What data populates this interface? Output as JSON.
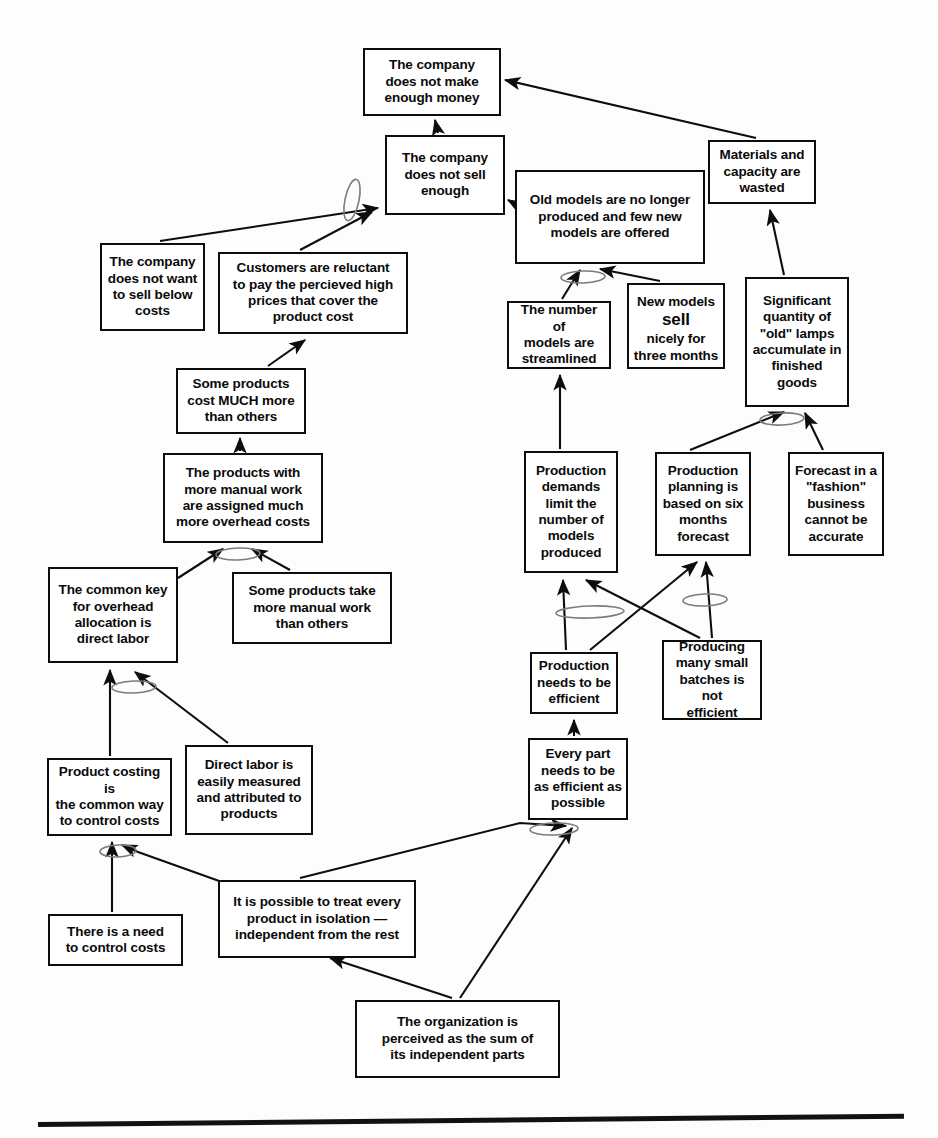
{
  "diagram": {
    "type": "cause-effect-tree",
    "stroke_color": "#0d0d0d",
    "background_color": "#ffffff",
    "nodes": [
      {
        "id": "n1",
        "text": "The company\ndoes not make\nenough money",
        "x": 363,
        "y": 48,
        "w": 138,
        "h": 68,
        "size": "md"
      },
      {
        "id": "n2",
        "text": "The company\ndoes not sell\nenough",
        "x": 385,
        "y": 135,
        "w": 120,
        "h": 80,
        "size": "md"
      },
      {
        "id": "n3",
        "text": "Old models are no longer\nproduced and few new\nmodels are offered",
        "x": 515,
        "y": 170,
        "w": 190,
        "h": 94,
        "size": "md"
      },
      {
        "id": "n4",
        "text": "Materials and\ncapacity are\nwasted",
        "x": 708,
        "y": 140,
        "w": 108,
        "h": 64,
        "size": "md"
      },
      {
        "id": "n5",
        "text": "The company\ndoes not want\nto sell below\ncosts",
        "x": 100,
        "y": 243,
        "w": 105,
        "h": 88,
        "size": "md"
      },
      {
        "id": "n6",
        "text": "Customers are reluctant\nto pay the percieved high\nprices that cover the\nproduct cost",
        "x": 218,
        "y": 252,
        "w": 190,
        "h": 82,
        "size": "md"
      },
      {
        "id": "n7",
        "text": "The number of\nmodels are\nstreamlined",
        "x": 507,
        "y": 301,
        "w": 104,
        "h": 68,
        "size": "md"
      },
      {
        "id": "n8",
        "text": "New models\nsell\nnicely for\nthree months",
        "x": 627,
        "y": 283,
        "w": 98,
        "h": 86,
        "size": "md",
        "emph_line": 1
      },
      {
        "id": "n9",
        "text": "Significant\nquantity of\n\"old\" lamps\naccumulate in\nfinished\ngoods",
        "x": 745,
        "y": 277,
        "w": 104,
        "h": 130,
        "size": "md"
      },
      {
        "id": "n10",
        "text": "Some products\ncost  MUCH more\nthan others",
        "x": 176,
        "y": 368,
        "w": 130,
        "h": 66,
        "size": "md"
      },
      {
        "id": "n11",
        "text": "The products with\nmore manual work\nare assigned much\nmore overhead costs",
        "x": 163,
        "y": 453,
        "w": 160,
        "h": 90,
        "size": "md"
      },
      {
        "id": "n12",
        "text": "Production\ndemands\nlimit the\nnumber of\nmodels\nproduced",
        "x": 524,
        "y": 451,
        "w": 94,
        "h": 122,
        "size": "md"
      },
      {
        "id": "n13",
        "text": "Production\nplanning is\nbased on six\nmonths\nforecast",
        "x": 655,
        "y": 452,
        "w": 96,
        "h": 104,
        "size": "md"
      },
      {
        "id": "n14",
        "text": "Forecast in a\n\"fashion\"\nbusiness\ncannot be\naccurate",
        "x": 788,
        "y": 452,
        "w": 96,
        "h": 104,
        "size": "md"
      },
      {
        "id": "n15",
        "text": "The common key\nfor overhead\nallocation is\ndirect labor",
        "x": 48,
        "y": 567,
        "w": 130,
        "h": 96,
        "size": "md"
      },
      {
        "id": "n16",
        "text": "Some products take\nmore manual work\nthan others",
        "x": 232,
        "y": 572,
        "w": 160,
        "h": 72,
        "size": "md"
      },
      {
        "id": "n17",
        "text": "Production\nneeds to be\nefficient",
        "x": 530,
        "y": 652,
        "w": 88,
        "h": 62,
        "size": "md"
      },
      {
        "id": "n18",
        "text": "Producing\nmany small\nbatches is not\nefficient",
        "x": 662,
        "y": 640,
        "w": 100,
        "h": 80,
        "size": "md"
      },
      {
        "id": "n19",
        "text": "Product costing is\nthe common way\nto control costs",
        "x": 47,
        "y": 758,
        "w": 125,
        "h": 78,
        "size": "md"
      },
      {
        "id": "n20",
        "text": "Direct labor is\neasily measured\nand attributed to\nproducts",
        "x": 185,
        "y": 745,
        "w": 128,
        "h": 90,
        "size": "md"
      },
      {
        "id": "n21",
        "text": "Every part\nneeds to be\nas efficient as\npossible",
        "x": 528,
        "y": 738,
        "w": 100,
        "h": 82,
        "size": "md"
      },
      {
        "id": "n22",
        "text": "It is possible to treat every\nproduct in isolation —\nindependent from the rest",
        "x": 218,
        "y": 880,
        "w": 198,
        "h": 78,
        "size": "md"
      },
      {
        "id": "n23",
        "text": "There is a need\nto control costs",
        "x": 48,
        "y": 914,
        "w": 135,
        "h": 52,
        "size": "md"
      },
      {
        "id": "n24",
        "text": "The organization is\nperceived as the sum of\nits independent parts",
        "x": 355,
        "y": 1000,
        "w": 205,
        "h": 78,
        "size": "md"
      }
    ],
    "edges": [
      {
        "from": "n2",
        "to": "n1",
        "label": "company does not sell enough causes not enough money"
      },
      {
        "from": "n4",
        "to": "n1",
        "label": "wasted materials cause not enough money"
      },
      {
        "from": "n5",
        "to": "n2",
        "label": "does not want to sell below costs causes not sell enough"
      },
      {
        "from": "n6",
        "to": "n2",
        "label": "reluctant customers cause not sell enough"
      },
      {
        "from": "n3",
        "to": "n2",
        "label": "old models not produced causes not sell enough"
      },
      {
        "from": "n7",
        "to": "n3",
        "label": "streamlined models cause old models not produced"
      },
      {
        "from": "n8",
        "to": "n3",
        "label": "new models sell nicely causes old models not produced"
      },
      {
        "from": "n9",
        "to": "n4",
        "label": "old lamps accumulate causes waste"
      },
      {
        "from": "n10",
        "to": "n6",
        "label": "cost differences cause reluctance"
      },
      {
        "from": "n11",
        "to": "n10",
        "label": "overhead assignment causes cost differences"
      },
      {
        "from": "n15",
        "to": "n11",
        "label": "common key overhead causes assignment"
      },
      {
        "from": "n16",
        "to": "n11",
        "label": "manual work differences cause assignment"
      },
      {
        "from": "n12",
        "to": "n7",
        "label": "production demands cause streamlining"
      },
      {
        "from": "n13",
        "to": "n9",
        "label": "six month forecast causes accumulation"
      },
      {
        "from": "n14",
        "to": "n9",
        "label": "inaccurate fashion forecast causes accumulation"
      },
      {
        "from": "n17",
        "to": "n12",
        "label": "production efficiency causes demand limits"
      },
      {
        "from": "n18",
        "to": "n12",
        "label": "small batches inefficient causes demand limits"
      },
      {
        "from": "n17",
        "to": "n13",
        "label": "production efficiency causes forecast planning"
      },
      {
        "from": "n18",
        "to": "n13",
        "label": "small batches inefficient causes forecast planning"
      },
      {
        "from": "n21",
        "to": "n17",
        "label": "every part efficient causes production efficiency"
      },
      {
        "from": "n19",
        "to": "n15",
        "label": "product costing causes overhead key"
      },
      {
        "from": "n20",
        "to": "n15",
        "label": "direct labor measurable causes overhead key"
      },
      {
        "from": "n23",
        "to": "n19",
        "label": "need to control costs causes product costing"
      },
      {
        "from": "n22",
        "to": "n19",
        "label": "treat products in isolation causes product costing"
      },
      {
        "from": "n22",
        "to": "n21",
        "label": "treat products in isolation causes every part efficient"
      },
      {
        "from": "n24",
        "to": "n22",
        "label": "organization as sum of parts causes isolation view"
      },
      {
        "from": "n24",
        "to": "n21",
        "label": "organization as sum of parts causes every part efficient"
      }
    ],
    "and_connectors": [
      {
        "id": "a1",
        "x": 350,
        "y": 197,
        "label": "and-connector-sell-enough",
        "rot": -78,
        "w": 42,
        "h": 15
      },
      {
        "id": "a2",
        "x": 577,
        "y": 276,
        "label": "and-connector-old-models",
        "rot": -2,
        "w": 44,
        "h": 12
      },
      {
        "id": "a3",
        "x": 760,
        "y": 419,
        "label": "and-connector-old-lamps",
        "rot": -3,
        "w": 44,
        "h": 12
      },
      {
        "id": "a4",
        "x": 216,
        "y": 553,
        "label": "and-connector-overhead-costs",
        "rot": -2,
        "w": 44,
        "h": 12
      },
      {
        "id": "a5",
        "x": 112,
        "y": 686,
        "label": "and-connector-overhead-key",
        "rot": -2,
        "w": 44,
        "h": 12
      },
      {
        "id": "a6",
        "x": 556,
        "y": 611,
        "label": "and-connector-production-demands",
        "rot": -2,
        "w": 68,
        "h": 12
      },
      {
        "id": "a7",
        "x": 683,
        "y": 599,
        "label": "and-connector-production-planning",
        "rot": -2,
        "w": 44,
        "h": 12
      },
      {
        "id": "a8",
        "x": 100,
        "y": 850,
        "label": "and-connector-product-costing",
        "rot": -2,
        "w": 36,
        "h": 12
      },
      {
        "id": "a9",
        "x": 530,
        "y": 828,
        "label": "and-connector-every-part",
        "rot": -2,
        "w": 48,
        "h": 12
      }
    ],
    "bottom_rule": {
      "label": "page-divider-rule"
    }
  }
}
